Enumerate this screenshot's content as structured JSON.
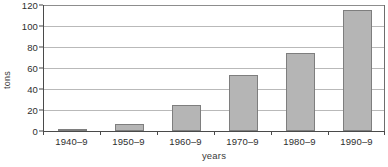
{
  "chart_data": {
    "type": "bar",
    "title": "",
    "xlabel": "years",
    "ylabel": "tons",
    "categories": [
      "1940–9",
      "1950–9",
      "1960–9",
      "1970–9",
      "1980–9",
      "1990–9"
    ],
    "values": [
      2,
      7,
      25,
      53,
      74,
      115
    ],
    "ylim": [
      0,
      120
    ],
    "yticks": [
      0,
      20,
      40,
      60,
      80,
      100,
      120
    ],
    "ytick_labels": [
      "0",
      "20",
      "40",
      "60",
      "80",
      "100",
      "120"
    ],
    "grid": true,
    "legend": false,
    "legend_position": "none",
    "series": [
      {
        "name": "tons",
        "values": [
          2,
          7,
          25,
          53,
          74,
          115
        ]
      }
    ]
  },
  "style": {
    "bar_fill": "#b5b5b5",
    "bar_border": "#7e7e7e",
    "gridline_color": "#b9b9b9",
    "axis_color": "#4a4a4a",
    "text_color": "#2e2e2e",
    "background": "#ffffff"
  }
}
